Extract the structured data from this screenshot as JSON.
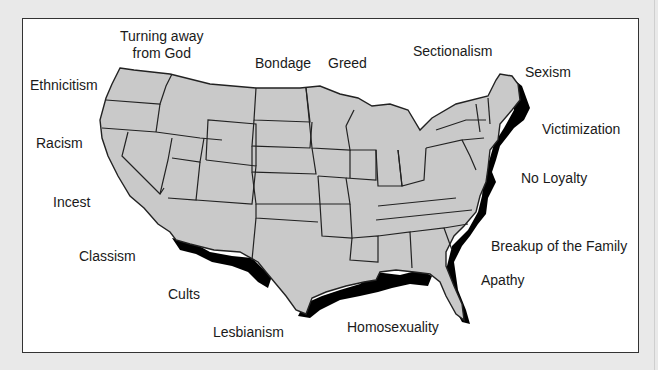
{
  "diagram": {
    "type": "map",
    "colors": {
      "background": "#e9e9e9",
      "panel": "#ffffff",
      "land": "#c9c9c9",
      "coast_shadow": "#000000",
      "border": "#222222"
    },
    "labels": [
      {
        "text": "Turning away from God",
        "line1": "Turning away",
        "line2": "from God"
      },
      {
        "text": "Ethnicitism"
      },
      {
        "text": "Bondage"
      },
      {
        "text": "Greed"
      },
      {
        "text": "Sectionalism"
      },
      {
        "text": "Sexism"
      },
      {
        "text": "Victimization"
      },
      {
        "text": "Racism"
      },
      {
        "text": "No Loyalty"
      },
      {
        "text": "Incest"
      },
      {
        "text": "Breakup of the Family"
      },
      {
        "text": "Classism"
      },
      {
        "text": "Apathy"
      },
      {
        "text": "Cults"
      },
      {
        "text": "Lesbianism"
      },
      {
        "text": "Homosexuality"
      }
    ]
  }
}
